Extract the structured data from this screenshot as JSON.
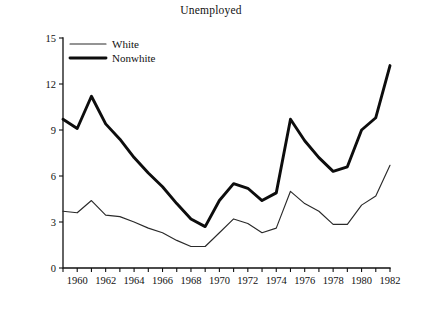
{
  "chart_data": {
    "type": "line",
    "title": "Unemployed",
    "xlabel": "",
    "ylabel": "Percentage",
    "xlim": [
      1959,
      1982
    ],
    "ylim": [
      0,
      15
    ],
    "ytick_labels": [
      "0",
      "3",
      "6",
      "9",
      "12",
      "15"
    ],
    "ytick_values": [
      0,
      3,
      6,
      9,
      12,
      15
    ],
    "xtick_labels": [
      "1960",
      "1962",
      "1964",
      "1966",
      "1968",
      "1970",
      "1972",
      "1974",
      "1976",
      "1978",
      "1980",
      "1982"
    ],
    "xtick_values": [
      1960,
      1962,
      1964,
      1966,
      1968,
      1970,
      1972,
      1974,
      1976,
      1978,
      1980,
      1982
    ],
    "minor_xticks": [
      1959,
      1961,
      1963,
      1965,
      1967,
      1969,
      1971,
      1973,
      1975,
      1977,
      1979,
      1981
    ],
    "grid": false,
    "legend_position": "top-left",
    "x": [
      1959,
      1960,
      1961,
      1962,
      1963,
      1964,
      1965,
      1966,
      1967,
      1968,
      1969,
      1970,
      1971,
      1972,
      1973,
      1974,
      1975,
      1976,
      1977,
      1978,
      1979,
      1980,
      1981,
      1982
    ],
    "series": [
      {
        "name": "White",
        "line_style": "thin",
        "color": "#2a2a2a",
        "values": [
          3.7,
          3.6,
          4.4,
          3.45,
          3.35,
          3.0,
          2.6,
          2.3,
          1.8,
          1.4,
          1.4,
          2.3,
          3.2,
          2.9,
          2.3,
          2.6,
          5.0,
          4.2,
          3.7,
          2.85,
          2.85,
          4.1,
          4.7,
          6.7
        ]
      },
      {
        "name": "Nonwhite",
        "line_style": "thick",
        "color": "#0d0d0d",
        "values": [
          9.7,
          9.1,
          11.2,
          9.4,
          8.4,
          7.2,
          6.2,
          5.3,
          4.2,
          3.2,
          2.7,
          4.4,
          5.5,
          5.2,
          4.4,
          4.9,
          9.7,
          8.3,
          7.2,
          6.3,
          6.6,
          9.0,
          9.8,
          13.2
        ]
      }
    ],
    "legend": [
      {
        "label": "White",
        "style": "thin"
      },
      {
        "label": "Nonwhite",
        "style": "thick"
      }
    ]
  }
}
